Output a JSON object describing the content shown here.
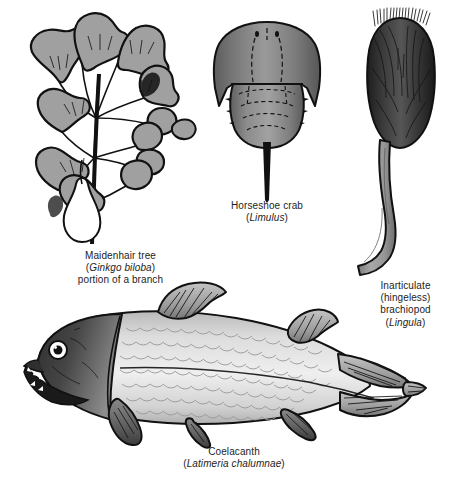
{
  "figure": {
    "background_color": "#ffffff"
  },
  "palette": {
    "ink": "#111111",
    "text": "#1d1d1d",
    "leaf_gray": "#a0a0a0",
    "shell_dark": "#2b2b2b",
    "shell_mid": "#6e6e6e",
    "carapace_gray": "#8a8a8a",
    "carapace_dark": "#5a5a5a",
    "pedicle_gray": "#9a9a9a",
    "fish_body_light": "#e8e8e8",
    "fish_body_mid": "#c9c9c9",
    "fish_head_dark": "#3a3a3a",
    "fish_fin_gray": "#8f8f8f",
    "white": "#ffffff"
  },
  "specimens": [
    {
      "id": "ginkgo",
      "common_name": "Maidenhair tree",
      "scientific_name": "Ginkgo biloba",
      "note": "portion of a branch",
      "caption_lines": [
        "Maidenhair tree",
        "(Ginkgo biloba)",
        "portion of a branch"
      ]
    },
    {
      "id": "horseshoe-crab",
      "common_name": "Horseshoe crab",
      "scientific_name": "Limulus",
      "note": "",
      "caption_lines": [
        "Horseshoe crab",
        "(Limulus)"
      ]
    },
    {
      "id": "brachiopod",
      "common_name": "Inarticulate (hingeless) brachiopod",
      "scientific_name": "Lingula",
      "note": "",
      "caption_lines": [
        "Inarticulate",
        "(hingeless)",
        "brachiopod",
        "(Lingula)"
      ]
    },
    {
      "id": "coelacanth",
      "common_name": "Coelacanth",
      "scientific_name": "Latimeria chalumnae",
      "note": "",
      "caption_lines": [
        "Coelacanth",
        "(Latimeria chalumnae)"
      ]
    }
  ],
  "captions": {
    "ginkgo": {
      "line1": "Maidenhair tree",
      "line2_open": "(",
      "line2_sci": "Ginkgo biloba",
      "line2_close": ")",
      "line3": "portion of a branch"
    },
    "horseshoe": {
      "line1": "Horseshoe crab",
      "line2_open": "(",
      "line2_sci": "Limulus",
      "line2_close": ")"
    },
    "brachiopod": {
      "line1": "Inarticulate",
      "line2": "(hingeless)",
      "line3": "brachiopod",
      "line4_open": "(",
      "line4_sci": "Lingula",
      "line4_close": ")"
    },
    "coelacanth": {
      "line1": "Coelacanth",
      "line2_open": "(",
      "line2_sci": "Latimeria chalumnae",
      "line2_close": ")"
    }
  }
}
